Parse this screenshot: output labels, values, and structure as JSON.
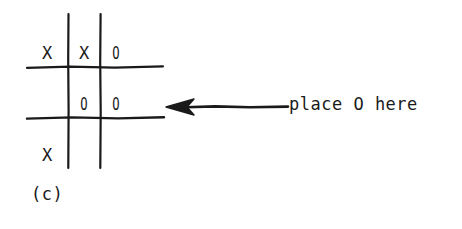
{
  "figure": {
    "caption": "(c)",
    "ink_color": "#1a1a1a",
    "background_color": "#ffffff"
  },
  "board": {
    "name": "tic-tac-toe-grid",
    "rows": 3,
    "columns": 3,
    "cells": [
      [
        {
          "mark": "X",
          "row": 0,
          "col": 0
        },
        {
          "mark": "X",
          "row": 0,
          "col": 1
        },
        {
          "mark": "O",
          "row": 0,
          "col": 2
        }
      ],
      [
        {
          "mark": "",
          "row": 1,
          "col": 0
        },
        {
          "mark": "O",
          "row": 1,
          "col": 1
        },
        {
          "mark": "O",
          "row": 1,
          "col": 2
        }
      ],
      [
        {
          "mark": "X",
          "row": 2,
          "col": 0
        },
        {
          "mark": "",
          "row": 2,
          "col": 1
        },
        {
          "mark": "",
          "row": 2,
          "col": 2
        }
      ]
    ]
  },
  "annotation": {
    "text": "place O here",
    "arrow": "left-arrow",
    "points_to_row": 1,
    "points_to_col": 2
  }
}
